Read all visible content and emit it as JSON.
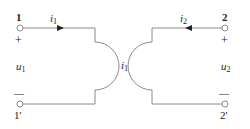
{
  "diagram": {
    "type": "two-port ideal transformer (coupled coils)",
    "colors": {
      "wire": "#8a8a8a",
      "text": "#222222",
      "background": "#ffffff"
    },
    "ports": {
      "left": {
        "top_terminal": "1",
        "bottom_terminal": "1'",
        "plus": "+",
        "minus": "—",
        "voltage_label": "u",
        "voltage_sub": "1",
        "current_label": "i",
        "current_sub": "1"
      },
      "right": {
        "top_terminal": "2",
        "bottom_terminal": "2'",
        "plus": "+",
        "minus": "—",
        "voltage_label": "u",
        "voltage_sub": "2",
        "current_label": "i",
        "current_sub": "2"
      }
    },
    "center_label": {
      "text": "i",
      "sub": "1"
    }
  }
}
